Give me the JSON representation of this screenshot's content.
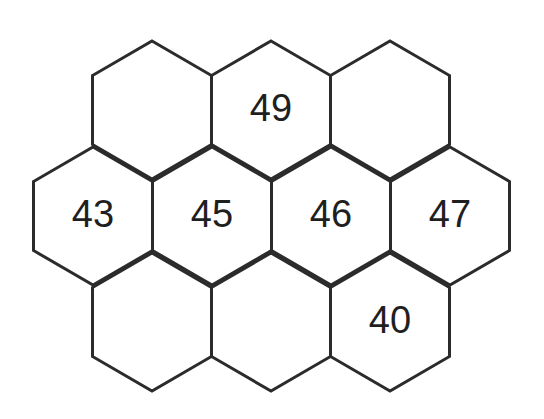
{
  "figure": {
    "background_color": "#ffffff",
    "stroke_color": "#2b2b2b",
    "stroke_width": 3,
    "label_color": "#1f1f1f",
    "label_font_size": 38,
    "orientation": "pointy-top",
    "hex_width": 119,
    "hex_height": 138,
    "rows": 3,
    "canvas": {
      "width": 544,
      "height": 419
    }
  },
  "cells": [
    {
      "id": "r0c0",
      "row": 0,
      "col": 0,
      "cx": 152,
      "cy": 110,
      "label": ""
    },
    {
      "id": "r0c1",
      "row": 0,
      "col": 1,
      "cx": 271,
      "cy": 110,
      "label": "49"
    },
    {
      "id": "r0c2",
      "row": 0,
      "col": 2,
      "cx": 390,
      "cy": 110,
      "label": ""
    },
    {
      "id": "r1c0",
      "row": 1,
      "col": 0,
      "cx": 93,
      "cy": 216,
      "label": "43"
    },
    {
      "id": "r1c1",
      "row": 1,
      "col": 1,
      "cx": 212,
      "cy": 216,
      "label": "45"
    },
    {
      "id": "r1c2",
      "row": 1,
      "col": 2,
      "cx": 331,
      "cy": 216,
      "label": "46"
    },
    {
      "id": "r1c3",
      "row": 1,
      "col": 3,
      "cx": 450,
      "cy": 216,
      "label": "47"
    },
    {
      "id": "r2c0",
      "row": 2,
      "col": 0,
      "cx": 152,
      "cy": 322,
      "label": ""
    },
    {
      "id": "r2c1",
      "row": 2,
      "col": 1,
      "cx": 271,
      "cy": 322,
      "label": ""
    },
    {
      "id": "r2c2",
      "row": 2,
      "col": 2,
      "cx": 390,
      "cy": 322,
      "label": "40"
    }
  ],
  "labels_visible": [
    "49",
    "43",
    "45",
    "46",
    "47",
    "40"
  ]
}
